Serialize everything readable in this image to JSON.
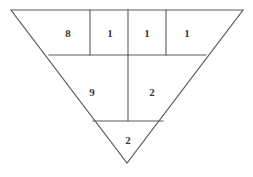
{
  "figure": {
    "background_color": "#ffffff",
    "stroke_color": "#5a5a5a",
    "text_color": "#3a3a3a",
    "canvas": {
      "width": 253,
      "height": 177
    },
    "shape": {
      "type": "inverted-triangle",
      "vertices": {
        "top_left": {
          "x": 11,
          "y": 10
        },
        "top_right": {
          "x": 243,
          "y": 10
        },
        "apex": {
          "x": 127,
          "y": 163
        }
      }
    },
    "dividers": {
      "horizontal": [
        {
          "name": "upper-band-divider",
          "y": 55,
          "x1": 49,
          "x2": 206
        },
        {
          "name": "lower-band-divider",
          "y": 121,
          "x1": 93,
          "x2": 163
        }
      ],
      "vertical": [
        {
          "name": "top-row-divider-1",
          "x": 90,
          "y1": 10,
          "y2": 55
        },
        {
          "name": "top-row-divider-2",
          "x": 128,
          "y1": 10,
          "y2": 55
        },
        {
          "name": "top-row-divider-3",
          "x": 166,
          "y1": 10,
          "y2": 55
        },
        {
          "name": "middle-row-divider",
          "x": 128,
          "y1": 55,
          "y2": 121
        }
      ]
    },
    "rows": [
      {
        "name": "top-row",
        "cells": [
          {
            "label": "8",
            "x": 68,
            "y": 33
          },
          {
            "label": "1",
            "x": 110,
            "y": 33
          },
          {
            "label": "1",
            "x": 147,
            "y": 33
          },
          {
            "label": "1",
            "x": 187,
            "y": 33
          }
        ]
      },
      {
        "name": "middle-row",
        "cells": [
          {
            "label": "9",
            "x": 92,
            "y": 92
          },
          {
            "label": "2",
            "x": 152,
            "y": 92
          }
        ]
      },
      {
        "name": "bottom-row",
        "cells": [
          {
            "label": "2",
            "x": 128,
            "y": 140
          }
        ]
      }
    ]
  }
}
